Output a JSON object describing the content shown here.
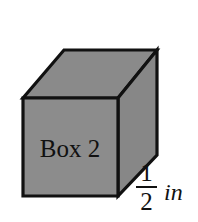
{
  "figure": {
    "type": "cube-diagram",
    "face_label": "Box 2",
    "colors": {
      "background": "#ffffff",
      "face_fill": "#8c8c8c",
      "top_fill": "#8a8a8a",
      "side_fill": "#878787",
      "stroke": "#111111",
      "text": "#111111"
    },
    "geometry": {
      "front_face_points": "23,98 118,98 118,196 23,196",
      "top_face_points": "23,98 64,50 157,50 118,98",
      "side_face_points": "118,98 157,50 157,155 118,196"
    }
  },
  "dimension": {
    "numerator": "1",
    "denominator": "2",
    "unit": "in"
  }
}
